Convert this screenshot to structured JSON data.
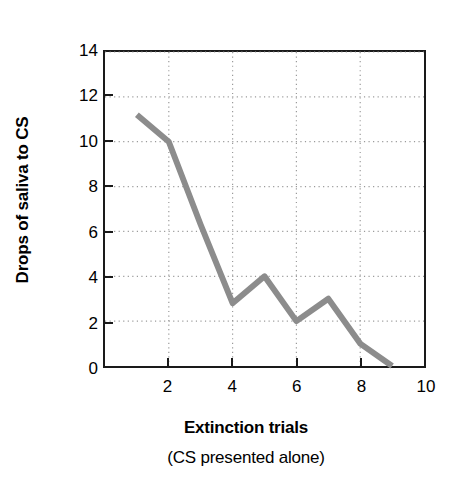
{
  "chart_data": {
    "type": "line",
    "title": "",
    "xlabel": "Extinction trials",
    "xlabel_sub": "(CS presented alone)",
    "ylabel": "Drops of saliva to CS",
    "x": [
      1,
      2,
      3,
      4,
      5,
      6,
      7,
      8,
      9
    ],
    "values": [
      11.2,
      10,
      6.3,
      2.8,
      4,
      2,
      3,
      1,
      0
    ],
    "series": [
      {
        "name": "Drops of saliva to CS",
        "values": [
          11.2,
          10,
          6.3,
          2.8,
          4,
          2,
          3,
          1,
          0
        ]
      }
    ],
    "xlim": [
      0,
      10
    ],
    "ylim": [
      0,
      14
    ],
    "x_ticks": [
      2,
      4,
      6,
      8,
      10
    ],
    "x_tick_labels": [
      "2",
      "4",
      "6",
      "8",
      "10"
    ],
    "y_ticks": [
      0,
      2,
      4,
      6,
      8,
      10,
      12,
      14
    ],
    "y_tick_labels": [
      "0",
      "2",
      "4",
      "6",
      "8",
      "10",
      "12",
      "14"
    ],
    "grid": true,
    "grid_style": "dotted",
    "legend": null,
    "line_color": "#8c8c8c",
    "line_width": 6,
    "axis_color": "#1a1a1a",
    "grid_color": "#9a9a9a",
    "background": "#ffffff"
  }
}
